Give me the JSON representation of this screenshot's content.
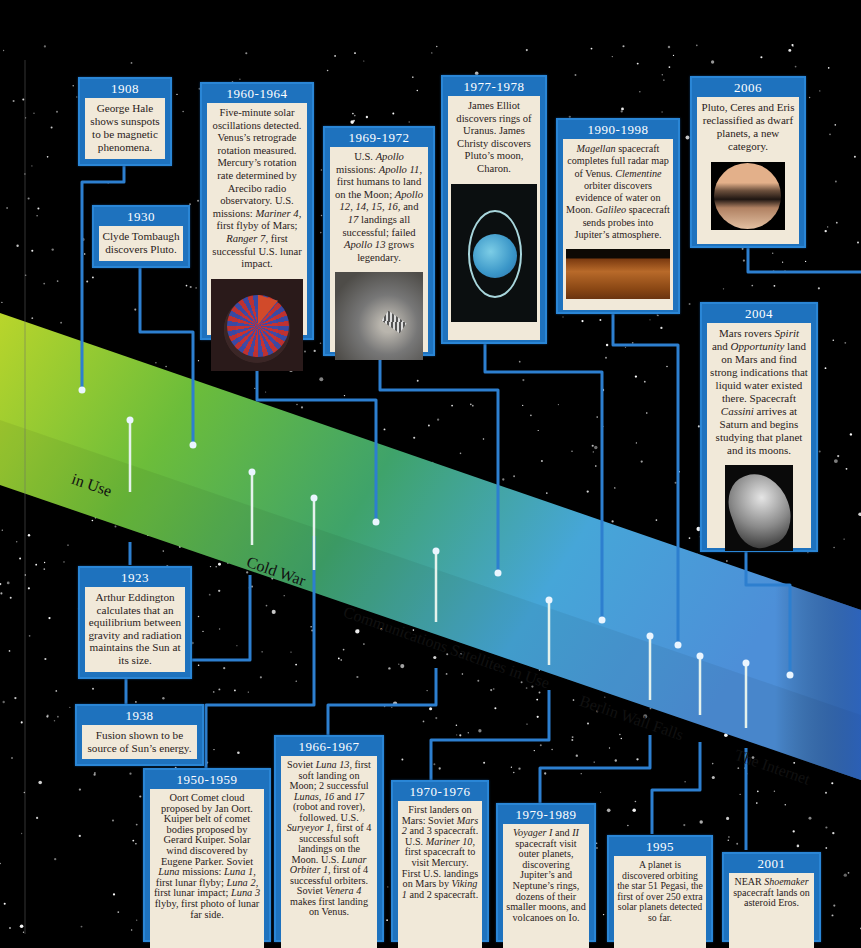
{
  "colors": {
    "box_header": "#1e72be",
    "box_border": "#2a86d6",
    "box_body": "#f1e9d9",
    "connector": "#2d7fcf",
    "band_start": "#b8d62a",
    "band_mid": "#3aa15a",
    "band_end": "#3e9fe0",
    "background": "#000000"
  },
  "eras": [
    {
      "label": "in Use"
    },
    {
      "label": "Cold War"
    },
    {
      "label": "Communications Satellites in Use"
    },
    {
      "label": "Berlin Wall Falls"
    },
    {
      "label": "The  Internet"
    }
  ],
  "events_top": [
    {
      "year": "1908",
      "text": "George Hale shows sunspots to be magnetic phenomena."
    },
    {
      "year": "1930",
      "text": "Clyde Tombaugh discovers Pluto."
    },
    {
      "year": "1960-1964",
      "text_html": "Five-minute solar oscillations detected. Venus’s retrograde rotation measured. Mercury’s rotation rate determined by Arecibo radio observatory.  U.S. missions: <i>Mariner 4</i>, first flyby of Mars; <i>Ranger 7</i>, first successful U.S. lunar impact.",
      "image": "sun-interior-image"
    },
    {
      "year": "1969-1972",
      "text_html": "U.S. <i>Apollo</i> missions: <i>Apollo 11</i>, first humans to land on the Moon; <i>Apollo 12, 14, 15, 16,</i> and <i>17</i> landings all successful; failed <i>Apollo 13</i> grows legendary.",
      "image": "moon-footprint-image"
    },
    {
      "year": "1977-1978",
      "text": "James Elliot discovers rings of Uranus. James Christy discovers Pluto’s moon, Charon.",
      "image": "uranus-rings-image"
    },
    {
      "year": "1990-1998",
      "text_html": "<i>Magellan</i> spacecraft completes full radar map of Venus. <i>Clementine</i> orbiter discovers evidence of water on Moon. <i>Galileo</i> spacecraft sends probes into Jupiter’s atmosphere.",
      "image": "venus-surface-image"
    },
    {
      "year": "2006",
      "text": "Pluto, Ceres and Eris reclassified as dwarf planets, a new category.",
      "image": "pluto-image"
    },
    {
      "year": "2004",
      "text_html": "Mars rovers <i>Spirit</i> and <i>Opportunity</i> land on Mars and find strong indications that liquid water existed there. Spacecraft <i>Cassini</i> arrives at Saturn and begins studying that planet and its moons.",
      "image": "saturn-moon-image"
    }
  ],
  "events_bottom": [
    {
      "year": "1923",
      "text": "Arthur Eddington calculates that an equilibrium between gravity and radiation maintains the Sun at its size."
    },
    {
      "year": "1938",
      "text": "Fusion shown to be source of Sun’s energy."
    },
    {
      "year": "1950-1959",
      "text_html": "Oort Comet cloud proposed by Jan Oort. Kuiper belt of comet bodies proposed by Gerard Kuiper. Solar wind discovered by Eugene Parker. Soviet <i>Luna</i> missions: <i>Luna 1</i>, first lunar flyby; <i>Luna 2</i>, first lunar impact; <i>Luna 3</i> flyby, first photo of lunar far side."
    },
    {
      "year": "1966-1967",
      "text_html": "Soviet <i>Luna 13</i>, first soft landing on Moon; 2 successful <i>Lunas, 16</i> and <i>17</i> (robot and rover), followed. U.S. <i>Suryeyor 1</i>, first of 4 successful soft landings on the Moon. U.S. <i>Lunar Orbiter 1</i>, first of 4 successful orbiters. Soviet <i>Venera 4</i> makes first landing on Venus."
    },
    {
      "year": "1970-1976",
      "text_html": "First landers on Mars: Soviet <i>Mars 2</i> and 3 spacecraft.  U.S. <i>Mariner 10</i>, first spacecraft to visit Mercury. First U.S. landings on Mars by <i>Viking 1</i> and 2 spacecraft."
    },
    {
      "year": "1979-1989",
      "text_html": "<i>Voyager I</i> and <i>II</i> spacecraft visit outer planets, discovering Jupiter’s and Neptune’s rings, dozens of their smaller moons, and volcanoes on Io."
    },
    {
      "year": "1995",
      "text": "A planet is discovered orbiting the star 51 Pegasi, the first of over 250 extra solar planets detected so far."
    },
    {
      "year": "2001",
      "text_html": "NEAR <i>Shoemaker</i> spacecraft lands on asteroid Eros."
    }
  ]
}
